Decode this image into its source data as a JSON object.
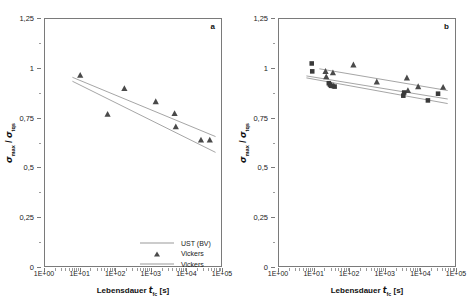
{
  "figure": {
    "panels": [
      {
        "id": "a",
        "letter": "a",
        "xlabel_prefix": "Lebensdauer ",
        "xlabel_symbol": "t",
        "xlabel_subscript": "fc",
        "xlabel_suffix": " [s]",
        "ylabel_num": "σ",
        "ylabel_num_sub": "max",
        "ylabel_sep": " / ",
        "ylabel_den": "σ",
        "ylabel_den_sub": "tqs",
        "yticks": [
          "0",
          "0,25",
          "0,5",
          "0,75",
          "1",
          "1,25"
        ],
        "xticks": [
          "1E+00",
          "1E+01",
          "1E+02",
          "1E+03",
          "1E+04",
          "1E+05"
        ],
        "legend": [
          {
            "label": "UST (BV)",
            "key": "line"
          },
          {
            "label": "Vickers",
            "key": "triangle"
          },
          {
            "label": "Vickers",
            "key": "line"
          }
        ]
      },
      {
        "id": "b",
        "letter": "b",
        "xlabel_prefix": "Lebensdauer ",
        "xlabel_symbol": "t",
        "xlabel_subscript": "fc",
        "xlabel_suffix": " [s]",
        "ylabel_num": "σ",
        "ylabel_num_sub": "max",
        "ylabel_sep": " / ",
        "ylabel_den": "σ",
        "ylabel_den_sub": "tqs",
        "yticks": [
          "0",
          "0,25",
          "0,5",
          "0,75",
          "1",
          "1,25"
        ],
        "xticks": [
          "1E+00",
          "1E+01",
          "1E+02",
          "1E+03",
          "1E+04",
          "1E+05"
        ],
        "legend": [
          {
            "label": "UST (BV)",
            "key": "line"
          },
          {
            "label": "Vickers",
            "key": "triangle"
          },
          {
            "label": "Vickers",
            "key": "line"
          },
          {
            "label": "Lagerungsdauer",
            "key": "square"
          },
          {
            "label": "Lagerungsdauer",
            "key": "line"
          }
        ]
      }
    ]
  },
  "chart_data": [
    {
      "type": "scatter",
      "panel": "a",
      "title": "",
      "xlabel": "Lebensdauer t_fc [s]",
      "ylabel": "sigma_max / sigma_tqs",
      "xscale": "log",
      "xlim": [
        1,
        100000
      ],
      "ylim": [
        0,
        1.25
      ],
      "yticks": [
        0,
        0.25,
        0.5,
        0.75,
        1,
        1.25
      ],
      "xticks": [
        1,
        10,
        100,
        1000,
        10000,
        100000
      ],
      "grid": false,
      "legend_position": "bottom-center",
      "series": [
        {
          "name": "Vickers",
          "marker": "triangle",
          "color": "#4a4a4a",
          "points": [
            {
              "x": 10,
              "y": 0.965
            },
            {
              "x": 60,
              "y": 0.768
            },
            {
              "x": 180,
              "y": 0.898
            },
            {
              "x": 1400,
              "y": 0.832
            },
            {
              "x": 4800,
              "y": 0.772
            },
            {
              "x": 5200,
              "y": 0.705
            },
            {
              "x": 27000,
              "y": 0.638
            },
            {
              "x": 48000,
              "y": 0.638
            }
          ]
        },
        {
          "name": "UST (BV)",
          "type": "line",
          "color": "#9a9a9a",
          "line": [
            {
              "x": 6,
              "y": 0.955
            },
            {
              "x": 70000,
              "y": 0.655
            }
          ]
        },
        {
          "name": "Vickers",
          "type": "line",
          "color": "#9a9a9a",
          "line": [
            {
              "x": 6,
              "y": 0.935
            },
            {
              "x": 70000,
              "y": 0.575
            }
          ]
        }
      ]
    },
    {
      "type": "scatter",
      "panel": "b",
      "title": "",
      "xlabel": "Lebensdauer t_fc [s]",
      "ylabel": "sigma_max / sigma_tqs",
      "xscale": "log",
      "xlim": [
        1,
        100000
      ],
      "ylim": [
        0,
        1.25
      ],
      "yticks": [
        0,
        0.25,
        0.5,
        0.75,
        1,
        1.25
      ],
      "xticks": [
        1,
        10,
        100,
        1000,
        10000,
        100000
      ],
      "grid": false,
      "legend_position": "bottom-center",
      "series": [
        {
          "name": "Vickers",
          "marker": "triangle",
          "color": "#4a4a4a",
          "points": [
            {
              "x": 21,
              "y": 0.985
            },
            {
              "x": 22,
              "y": 0.958
            },
            {
              "x": 34,
              "y": 0.978
            },
            {
              "x": 36,
              "y": 0.912
            },
            {
              "x": 130,
              "y": 1.018
            },
            {
              "x": 600,
              "y": 0.932
            },
            {
              "x": 4300,
              "y": 0.952
            },
            {
              "x": 4600,
              "y": 0.888
            },
            {
              "x": 9000,
              "y": 0.908
            },
            {
              "x": 46000,
              "y": 0.905
            }
          ]
        },
        {
          "name": "Lagerungsdauer",
          "marker": "square",
          "color": "#3a3a3a",
          "points": [
            {
              "x": 8.5,
              "y": 1.025
            },
            {
              "x": 8.8,
              "y": 0.985
            },
            {
              "x": 26,
              "y": 0.925
            },
            {
              "x": 28,
              "y": 0.918
            },
            {
              "x": 30,
              "y": 0.912
            },
            {
              "x": 38,
              "y": 0.908
            },
            {
              "x": 3400,
              "y": 0.862
            },
            {
              "x": 3600,
              "y": 0.878
            },
            {
              "x": 17000,
              "y": 0.838
            },
            {
              "x": 33000,
              "y": 0.872
            }
          ]
        },
        {
          "name": "UST (BV)",
          "type": "line",
          "color": "#9a9a9a",
          "line": [
            {
              "x": 14,
              "y": 0.998
            },
            {
              "x": 62000,
              "y": 0.888
            }
          ]
        },
        {
          "name": "Vickers",
          "type": "line",
          "color": "#9a9a9a",
          "line": [
            {
              "x": 6,
              "y": 0.962
            },
            {
              "x": 62000,
              "y": 0.845
            }
          ]
        },
        {
          "name": "Lagerungsdauer",
          "type": "line",
          "color": "#9a9a9a",
          "line": [
            {
              "x": 6,
              "y": 0.952
            },
            {
              "x": 62000,
              "y": 0.822
            }
          ]
        }
      ]
    }
  ]
}
